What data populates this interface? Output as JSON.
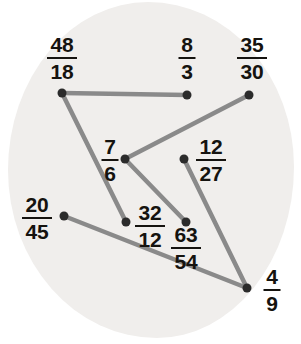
{
  "worksheet": {
    "title": "Equivalent fractions matching puzzle",
    "background_color": "#f0eeec",
    "line_color": "#8a8a8a",
    "node_color": "#2b2b2b",
    "text_color": "#15130f"
  },
  "nodes": [
    {
      "id": "n1",
      "numerator": "48",
      "denominator": "18",
      "label": "48/18",
      "dot_x": 62,
      "dot_y": 93,
      "label_x": 62,
      "label_y": 58,
      "bar_width": 30
    },
    {
      "id": "n2",
      "numerator": "8",
      "denominator": "3",
      "label": "8/3",
      "dot_x": 187,
      "dot_y": 95,
      "label_x": 187,
      "label_y": 58,
      "bar_width": 17
    },
    {
      "id": "n3",
      "numerator": "35",
      "denominator": "30",
      "label": "35/30",
      "dot_x": 249,
      "dot_y": 95,
      "label_x": 252,
      "label_y": 58,
      "bar_width": 30
    },
    {
      "id": "n4",
      "numerator": "7",
      "denominator": "6",
      "label": "7/6",
      "dot_x": 125,
      "dot_y": 159,
      "label_x": 110,
      "label_y": 160,
      "bar_width": 17
    },
    {
      "id": "n5",
      "numerator": "12",
      "denominator": "27",
      "label": "12/27",
      "dot_x": 184,
      "dot_y": 159,
      "label_x": 211,
      "label_y": 160,
      "bar_width": 30
    },
    {
      "id": "n6",
      "numerator": "20",
      "denominator": "45",
      "label": "20/45",
      "dot_x": 64,
      "dot_y": 216,
      "label_x": 37,
      "label_y": 218,
      "bar_width": 30
    },
    {
      "id": "n7",
      "numerator": "32",
      "denominator": "12",
      "label": "32/12",
      "dot_x": 126,
      "dot_y": 222,
      "label_x": 150,
      "label_y": 226,
      "bar_width": 30
    },
    {
      "id": "n8",
      "numerator": "63",
      "denominator": "54",
      "label": "63/54",
      "dot_x": 186,
      "dot_y": 222,
      "label_x": 186,
      "label_y": 248,
      "bar_width": 30
    },
    {
      "id": "n9",
      "numerator": "4",
      "denominator": "9",
      "label": "4/9",
      "dot_x": 247,
      "dot_y": 288,
      "label_x": 272,
      "label_y": 290,
      "bar_width": 17
    }
  ],
  "edges": [
    {
      "from": "n1",
      "to": "n2",
      "x1": 62,
      "y1": 93,
      "x2": 187,
      "y2": 95
    },
    {
      "from": "n1",
      "to": "n7",
      "x1": 62,
      "y1": 93,
      "x2": 126,
      "y2": 222
    },
    {
      "from": "n3",
      "to": "n4",
      "x1": 249,
      "y1": 95,
      "x2": 125,
      "y2": 159
    },
    {
      "from": "n4",
      "to": "n8",
      "x1": 125,
      "y1": 159,
      "x2": 186,
      "y2": 222
    },
    {
      "from": "n5",
      "to": "n9",
      "x1": 184,
      "y1": 159,
      "x2": 247,
      "y2": 288
    },
    {
      "from": "n6",
      "to": "n9",
      "x1": 64,
      "y1": 216,
      "x2": 247,
      "y2": 288
    }
  ]
}
